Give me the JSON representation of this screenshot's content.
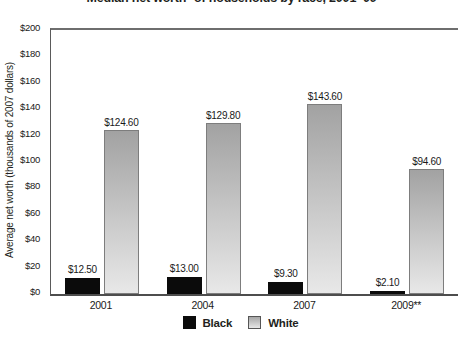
{
  "chart": {
    "title": "Median net worth* of households by race, 2001–09",
    "ylabel": "Average net worth (thousands of 2007 dollars)"
  },
  "chart_data": {
    "type": "bar",
    "title": "Median net worth* of households by race, 2001–09",
    "xlabel": "",
    "ylabel": "Average net worth (thousands of 2007 dollars)",
    "categories": [
      "2001",
      "2004",
      "2007",
      "2009**"
    ],
    "series": [
      {
        "name": "Black",
        "color": "#0b0b0b",
        "values": [
          12.5,
          13.0,
          9.3,
          2.1
        ],
        "labels": [
          "$12.50",
          "$13.00",
          "$9.30",
          "$2.10"
        ]
      },
      {
        "name": "White",
        "color_top": "#a2a2a2",
        "color_bottom": "#e8e8e8",
        "border_color": "#7d7d7d",
        "values": [
          124.6,
          129.8,
          143.6,
          94.6
        ],
        "labels": [
          "$124.60",
          "$129.80",
          "$143.60",
          "$94.60"
        ]
      }
    ],
    "ylim": [
      0,
      200
    ],
    "ytick_step": 20,
    "ytick_labels": [
      "$0",
      "$20",
      "$40",
      "$60",
      "$80",
      "$100",
      "$120",
      "$140",
      "$160",
      "$180",
      "$200"
    ],
    "grid": false,
    "top_rule_at": 200,
    "legend": {
      "position": "bottom",
      "entries": [
        "Black",
        "White"
      ]
    }
  }
}
